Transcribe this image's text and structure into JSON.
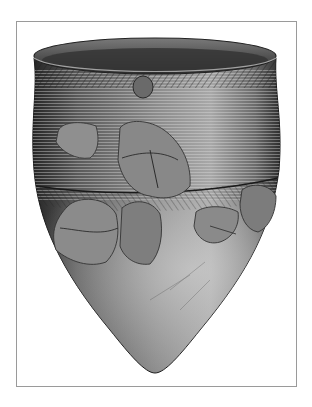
{
  "image": {
    "subject": "pointed-base pottery vessel illustration",
    "style": "grayscale stippled drawing",
    "colors": {
      "background": "#ffffff",
      "frame_border": "#9a9a9a",
      "pot_dark": "#2a2a2a",
      "pot_mid": "#6e6e6e",
      "pot_light": "#b8b8b8",
      "shard_fill": "#8a8a8a",
      "interior": "#3a3a3a"
    },
    "frame": {
      "x": 16,
      "y": 21,
      "width": 281,
      "height": 366
    },
    "vessel": {
      "rim": {
        "cx": 155,
        "cy": 56,
        "rx": 121,
        "ry": 18
      },
      "widest_y": 190,
      "left_x": 34,
      "right_x": 279,
      "tip": {
        "x": 155,
        "y": 373
      }
    },
    "features": [
      "cord-marked herringbone rim band",
      "horizontal seam at mid-body",
      "restored shard patches",
      "small applied knob below rim"
    ]
  }
}
